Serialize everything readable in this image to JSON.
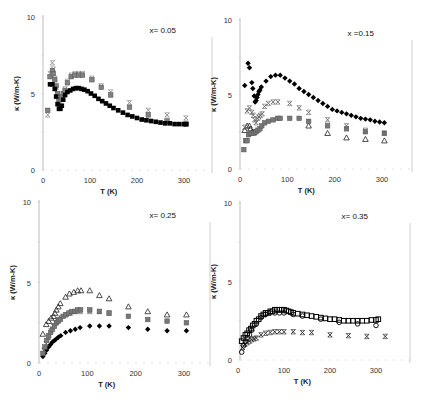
{
  "figure": {
    "panel_count": 4,
    "shared_xlabel": "T (K)",
    "shared_ylabel": "κ (W/m-K)"
  },
  "chart_data": [
    {
      "type": "scatter",
      "id": "panel-x005",
      "annotation": "x= 0.05",
      "xlabel": "T (K)",
      "ylabel": "κ (W/m-K)",
      "xlim": [
        0,
        330
      ],
      "ylim": [
        0,
        10
      ],
      "xticks": [
        0,
        100,
        200,
        300
      ],
      "yticks": [
        0,
        5,
        10
      ],
      "grid": false,
      "legend": null,
      "frame": {
        "left": 43,
        "right": 212,
        "top": 17,
        "bottom": 170,
        "x0": 43,
        "x300": 184
      },
      "series": [
        {
          "name": "series-1",
          "marker": "square-filled",
          "color": "#000000",
          "x": [
            15,
            20,
            25,
            28,
            31,
            34,
            37,
            40,
            43,
            47,
            52,
            58,
            64,
            70,
            76,
            82,
            88,
            95,
            102,
            110,
            118,
            126,
            134,
            142,
            150,
            160,
            170,
            180,
            190,
            200,
            210,
            220,
            230,
            240,
            250,
            260,
            270,
            280,
            290,
            300,
            305
          ],
          "y": [
            5.6,
            5.6,
            5.3,
            4.8,
            4.3,
            4.0,
            4.0,
            4.2,
            4.6,
            4.9,
            5.1,
            5.2,
            5.3,
            5.35,
            5.35,
            5.3,
            5.25,
            5.15,
            5.0,
            4.85,
            4.65,
            4.5,
            4.35,
            4.2,
            4.05,
            3.9,
            3.75,
            3.6,
            3.5,
            3.4,
            3.3,
            3.25,
            3.2,
            3.15,
            3.1,
            3.05,
            3.05,
            3.0,
            3.0,
            3.0,
            3.0
          ]
        },
        {
          "name": "series-2",
          "marker": "square-gray",
          "color": "#808080",
          "x": [
            10,
            15,
            20,
            22,
            25,
            28,
            31,
            34,
            37,
            40,
            43,
            47,
            52,
            60,
            68,
            76,
            84,
            104,
            124,
            144,
            184,
            224,
            264,
            304
          ],
          "y": [
            3.9,
            6.1,
            6.5,
            6.3,
            5.9,
            5.5,
            5.0,
            4.6,
            4.6,
            4.8,
            5.0,
            5.2,
            5.7,
            6.1,
            6.2,
            6.2,
            6.2,
            5.9,
            5.4,
            4.9,
            4.1,
            3.6,
            3.2,
            3.0
          ]
        },
        {
          "name": "series-3",
          "marker": "x-gray",
          "color": "#888888",
          "x": [
            10,
            15,
            20,
            22,
            25,
            28,
            31,
            34,
            37,
            40,
            43,
            47,
            52,
            60,
            68,
            76,
            84,
            104,
            124,
            144,
            184,
            224,
            264,
            304
          ],
          "y": [
            3.6,
            6.3,
            7.0,
            6.6,
            6.0,
            5.4,
            4.9,
            4.5,
            4.4,
            4.7,
            5.0,
            5.3,
            5.8,
            6.2,
            6.3,
            6.3,
            6.3,
            6.0,
            5.5,
            5.1,
            4.4,
            3.9,
            3.6,
            3.4
          ]
        }
      ]
    },
    {
      "type": "scatter",
      "id": "panel-x015",
      "annotation": "x =0.15",
      "xlabel": "T (K)",
      "ylabel": "κ (W/m-K)",
      "xlim": [
        0,
        330
      ],
      "ylim": [
        0,
        10
      ],
      "xticks": [
        0,
        100,
        200,
        300
      ],
      "yticks": [
        0,
        5,
        10
      ],
      "grid": false,
      "legend": null,
      "frame": {
        "left": 240,
        "right": 412,
        "top": 20,
        "bottom": 169,
        "x0": 240,
        "x300": 382
      },
      "series": [
        {
          "name": "series-1",
          "marker": "diamond-filled",
          "color": "#000000",
          "x": [
            10,
            17,
            20,
            25,
            27,
            30,
            32,
            34,
            36,
            38,
            40,
            42,
            45,
            55,
            65,
            75,
            85,
            95,
            105,
            115,
            125,
            135,
            145,
            155,
            165,
            175,
            185,
            195,
            205,
            215,
            225,
            235,
            245,
            255,
            265,
            275,
            285,
            295,
            305
          ],
          "y": [
            5.6,
            7.1,
            6.8,
            5.8,
            5.4,
            4.9,
            4.5,
            4.6,
            4.8,
            5.0,
            5.2,
            5.3,
            5.5,
            5.9,
            6.2,
            6.3,
            6.3,
            6.1,
            5.9,
            5.7,
            5.4,
            5.2,
            5.0,
            4.8,
            4.6,
            4.4,
            4.2,
            4.0,
            3.9,
            3.8,
            3.7,
            3.6,
            3.5,
            3.4,
            3.35,
            3.3,
            3.2,
            3.15,
            3.1
          ]
        },
        {
          "name": "series-2",
          "marker": "x-gray",
          "color": "#666666",
          "x": [
            10,
            15,
            20,
            25,
            28,
            31,
            34,
            37,
            40,
            43,
            47,
            52,
            60,
            70,
            80,
            105,
            125,
            145,
            185,
            225,
            265,
            305
          ],
          "y": [
            2.8,
            3.9,
            4.1,
            3.8,
            3.6,
            3.3,
            3.1,
            3.4,
            3.5,
            3.6,
            3.7,
            4.2,
            4.4,
            4.5,
            4.5,
            4.4,
            4.1,
            3.8,
            3.3,
            2.9,
            2.6,
            2.4
          ]
        },
        {
          "name": "series-3",
          "marker": "square-gray",
          "color": "#777777",
          "x": [
            8,
            12,
            15,
            18,
            22,
            26,
            30,
            34,
            38,
            42,
            46,
            52,
            60,
            70,
            80,
            85,
            105,
            125,
            145,
            185,
            225,
            265,
            305
          ],
          "y": [
            1.3,
            1.9,
            1.9,
            2.3,
            2.4,
            2.4,
            2.4,
            2.5,
            2.6,
            2.7,
            2.9,
            3.1,
            3.2,
            3.3,
            3.4,
            3.4,
            3.4,
            3.4,
            3.2,
            2.9,
            2.7,
            2.5,
            2.4
          ]
        },
        {
          "name": "series-4",
          "marker": "triangle-open",
          "color": "#222222",
          "x": [
            10,
            15,
            20,
            22,
            26,
            30,
            145,
            185,
            225,
            265,
            305
          ],
          "y": [
            2.6,
            2.9,
            2.9,
            2.7,
            2.5,
            2.5,
            2.9,
            2.4,
            2.1,
            2.0,
            1.9
          ]
        }
      ]
    },
    {
      "type": "scatter",
      "id": "panel-x025",
      "annotation": "x= 0.25",
      "xlabel": "T (K)",
      "ylabel": "κ (W/m-K)",
      "xlim": [
        0,
        330
      ],
      "ylim": [
        0,
        10
      ],
      "xticks": [
        0,
        100,
        200,
        300
      ],
      "yticks": [
        0,
        5,
        10
      ],
      "grid": false,
      "legend": null,
      "frame": {
        "left": 39,
        "right": 210,
        "top": 202,
        "bottom": 363,
        "x0": 39,
        "x300": 184
      },
      "series": [
        {
          "name": "series-1",
          "marker": "triangle-open",
          "color": "#222222",
          "x": [
            8,
            15,
            20,
            25,
            30,
            33,
            36,
            40,
            44,
            55,
            63,
            72,
            80,
            87,
            105,
            125,
            145,
            185,
            225,
            265,
            305
          ],
          "y": [
            1.8,
            2.4,
            2.6,
            2.8,
            2.9,
            3.1,
            3.3,
            3.5,
            3.7,
            4.1,
            4.3,
            4.4,
            4.5,
            4.5,
            4.5,
            4.2,
            4.0,
            3.5,
            3.2,
            3.0,
            3.0
          ]
        },
        {
          "name": "series-2",
          "marker": "square-gray",
          "color": "#777777",
          "x": [
            8,
            12,
            16,
            20,
            24,
            28,
            32,
            36,
            40,
            44,
            50,
            56,
            62,
            68,
            74,
            80,
            86,
            105,
            125,
            145,
            185,
            225,
            265,
            305
          ],
          "y": [
            0.6,
            1.0,
            1.4,
            1.7,
            1.9,
            2.1,
            2.3,
            2.5,
            2.6,
            2.7,
            2.9,
            3.0,
            3.1,
            3.2,
            3.2,
            3.3,
            3.3,
            3.3,
            3.2,
            3.1,
            2.9,
            2.7,
            2.6,
            2.5
          ]
        },
        {
          "name": "series-3",
          "marker": "x-gray",
          "color": "#555555",
          "x": [
            10,
            15,
            20,
            25,
            30,
            35,
            40,
            45,
            55,
            65,
            75,
            85,
            105,
            125,
            145
          ],
          "y": [
            0.8,
            1.2,
            1.6,
            2.0,
            2.3,
            2.5,
            2.7,
            2.8,
            3.0,
            3.1,
            3.2,
            3.2,
            3.2,
            3.2,
            3.1
          ]
        },
        {
          "name": "series-4",
          "marker": "diamond-filled",
          "color": "#000000",
          "x": [
            8,
            12,
            16,
            20,
            24,
            28,
            32,
            36,
            40,
            45,
            55,
            65,
            75,
            85,
            105,
            125,
            145,
            185,
            225,
            265,
            305
          ],
          "y": [
            0.4,
            0.6,
            0.8,
            1.0,
            1.15,
            1.3,
            1.4,
            1.5,
            1.6,
            1.7,
            1.9,
            2.0,
            2.1,
            2.2,
            2.3,
            2.3,
            2.3,
            2.2,
            2.1,
            2.0,
            2.0
          ]
        }
      ]
    },
    {
      "type": "scatter",
      "id": "panel-x035",
      "annotation": "x= 0.35",
      "xlabel": "T (K)",
      "ylabel": "κ (W/m-K)",
      "xlim": [
        0,
        330
      ],
      "ylim": [
        0,
        10
      ],
      "xticks": [
        0,
        100,
        200,
        300
      ],
      "yticks": [
        0,
        5,
        10
      ],
      "grid": false,
      "legend": null,
      "frame": {
        "left": 240,
        "right": 410,
        "top": 203,
        "bottom": 360,
        "x0": 238,
        "x300": 376
      },
      "series": [
        {
          "name": "series-1",
          "marker": "square-open",
          "color": "#000000",
          "x": [
            8,
            12,
            16,
            20,
            24,
            28,
            32,
            36,
            40,
            45,
            50,
            55,
            60,
            65,
            70,
            75,
            80,
            85,
            90,
            95,
            100,
            105,
            110,
            115,
            120,
            130,
            140,
            150,
            160,
            170,
            180,
            190,
            200,
            210,
            220,
            230,
            240,
            250,
            260,
            270,
            280,
            290,
            300,
            305
          ],
          "y": [
            1.2,
            1.4,
            1.6,
            1.7,
            1.9,
            2.0,
            2.2,
            2.3,
            2.5,
            2.6,
            2.8,
            2.9,
            3.0,
            3.0,
            3.1,
            3.1,
            3.2,
            3.2,
            3.2,
            3.2,
            3.2,
            3.15,
            3.1,
            3.05,
            3.0,
            2.95,
            2.9,
            2.85,
            2.8,
            2.75,
            2.7,
            2.65,
            2.6,
            2.6,
            2.55,
            2.5,
            2.5,
            2.5,
            2.5,
            2.5,
            2.5,
            2.55,
            2.55,
            2.6
          ]
        },
        {
          "name": "series-2",
          "marker": "circle-open",
          "color": "#000000",
          "x": [
            8,
            12,
            16,
            20,
            25,
            30,
            40,
            50,
            60,
            70,
            80,
            90,
            100,
            120,
            140,
            180,
            220,
            260,
            300
          ],
          "y": [
            0.5,
            0.9,
            1.2,
            1.4,
            1.6,
            1.9,
            2.3,
            2.7,
            2.9,
            3.0,
            3.0,
            3.0,
            3.0,
            2.9,
            2.8,
            2.6,
            2.4,
            2.3,
            2.2
          ]
        },
        {
          "name": "series-3",
          "marker": "x-black",
          "color": "#222222",
          "x": [
            10,
            15,
            20,
            25,
            30,
            35,
            40,
            50,
            60,
            70,
            80,
            90,
            100,
            120,
            140,
            160,
            200,
            240,
            280,
            320
          ],
          "y": [
            0.8,
            1.0,
            1.1,
            1.2,
            1.3,
            1.35,
            1.4,
            1.6,
            1.7,
            1.75,
            1.8,
            1.8,
            1.8,
            1.8,
            1.75,
            1.75,
            1.6,
            1.55,
            1.5,
            1.5
          ]
        }
      ]
    }
  ]
}
